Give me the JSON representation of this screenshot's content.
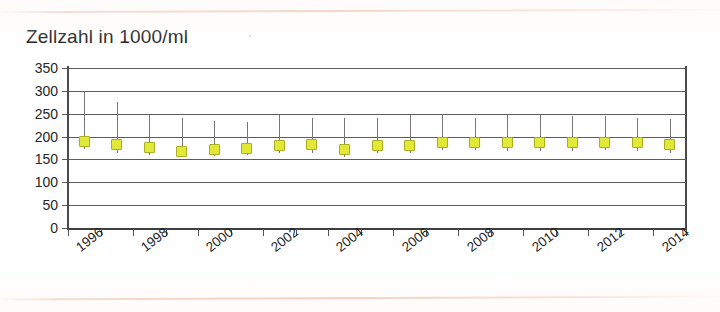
{
  "chart_data": {
    "type": "scatter",
    "title": "Zellzahl in 1000/ml",
    "xlabel": "",
    "ylabel": "",
    "ylim": [
      0,
      350
    ],
    "yticks": [
      0,
      50,
      100,
      150,
      200,
      250,
      300,
      350
    ],
    "ytick_labels": [
      "0",
      "50",
      "100",
      "150",
      "200",
      "250",
      "300",
      "350"
    ],
    "grid": true,
    "legend": null,
    "x": [
      1996,
      1997,
      1998,
      1999,
      2000,
      2001,
      2002,
      2003,
      2004,
      2005,
      2006,
      2007,
      2008,
      2009,
      2010,
      2011,
      2012,
      2013,
      2014
    ],
    "xtick_labels": [
      "1996",
      "1998",
      "2000",
      "2002",
      "2004",
      "2006",
      "2008",
      "2010",
      "2012",
      "2014"
    ],
    "xtick_label_years": [
      1996,
      1998,
      2000,
      2002,
      2004,
      2006,
      2008,
      2010,
      2012,
      2014
    ],
    "values": [
      190,
      183,
      176,
      168,
      172,
      173,
      180,
      182,
      172,
      181,
      180,
      187,
      188,
      186,
      186,
      187,
      188,
      186,
      182
    ],
    "error_high": [
      300,
      275,
      248,
      240,
      235,
      232,
      248,
      240,
      240,
      240,
      248,
      250,
      240,
      248,
      248,
      245,
      245,
      240,
      238
    ],
    "error_low": [
      172,
      165,
      160,
      158,
      158,
      160,
      165,
      163,
      156,
      163,
      163,
      170,
      170,
      168,
      168,
      169,
      170,
      168,
      165
    ],
    "marker_fill": "#e2e836",
    "marker_edge": "#a9ae24",
    "errorbar_color": "#777777",
    "axis_color": "#4a4a4a",
    "grid_color": "#5c5c5c"
  }
}
